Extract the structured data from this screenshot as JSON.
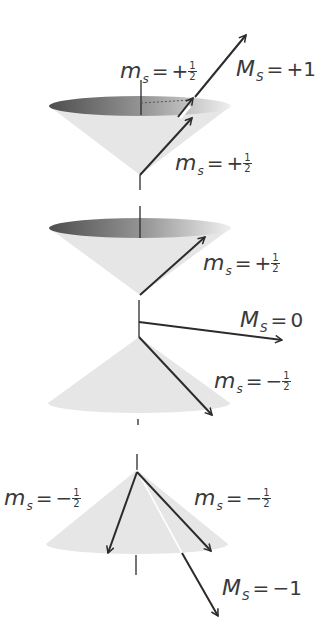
{
  "diagram": {
    "colors": {
      "arrow": "#2b2b2b",
      "cone_fill": "#e4e4e4",
      "rim_dark": "#5a5a5a",
      "rim_light": "#ececec",
      "text": "#3a3a3a"
    },
    "states": [
      {
        "name": "triplet-plus-one",
        "total_label": {
          "symbol": "M",
          "subscript": "S",
          "equals": "=",
          "value": "+1"
        },
        "electron_labels": [
          {
            "symbol": "m",
            "subscript": "s",
            "equals": "=",
            "sign": "+",
            "num": "1",
            "den": "2"
          },
          {
            "symbol": "m",
            "subscript": "s",
            "equals": "=",
            "sign": "+",
            "num": "1",
            "den": "2"
          }
        ]
      },
      {
        "name": "triplet-zero",
        "total_label": {
          "symbol": "M",
          "subscript": "S",
          "equals": "=",
          "value": "0"
        },
        "electron_labels": [
          {
            "symbol": "m",
            "subscript": "s",
            "equals": "=",
            "sign": "+",
            "num": "1",
            "den": "2"
          },
          {
            "symbol": "m",
            "subscript": "s",
            "equals": "=",
            "sign": "−",
            "num": "1",
            "den": "2"
          }
        ]
      },
      {
        "name": "triplet-minus-one",
        "total_label": {
          "symbol": "M",
          "subscript": "S",
          "equals": "=",
          "value": "−1"
        },
        "electron_labels": [
          {
            "symbol": "m",
            "subscript": "s",
            "equals": "=",
            "sign": "−",
            "num": "1",
            "den": "2"
          },
          {
            "symbol": "m",
            "subscript": "s",
            "equals": "=",
            "sign": "−",
            "num": "1",
            "den": "2"
          }
        ]
      }
    ]
  }
}
